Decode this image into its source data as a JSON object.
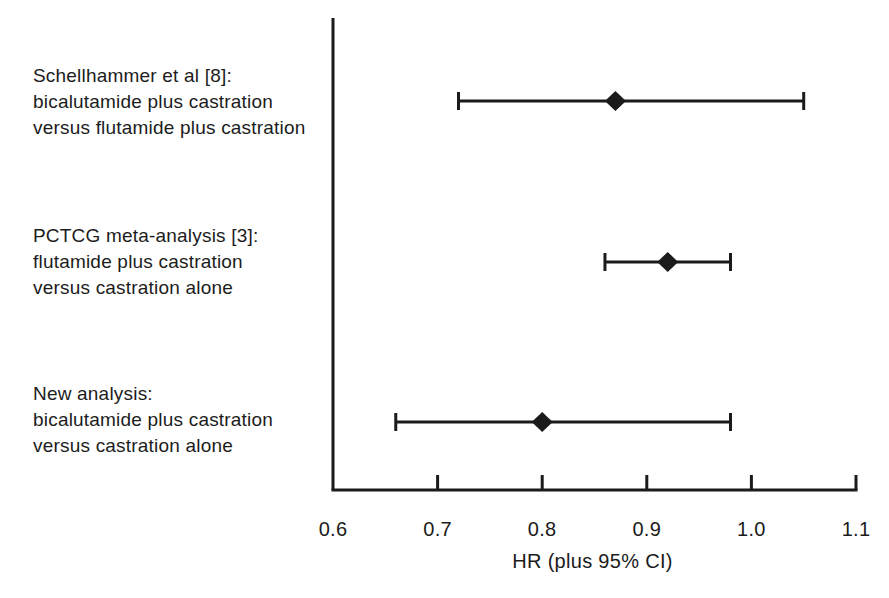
{
  "colors": {
    "foreground": "#1b1b1b",
    "background": "#ffffff"
  },
  "chart_data": {
    "type": "scatter",
    "subtype": "forest-plot",
    "title": "",
    "xlabel": "HR (plus 95% CI)",
    "ylabel": "",
    "xlim": [
      0.6,
      1.1
    ],
    "x_ticks": [
      0.6,
      0.7,
      0.8,
      0.9,
      1.0,
      1.1
    ],
    "x_tick_labels": [
      "0.6",
      "0.7",
      "0.8",
      "0.9",
      "1.0",
      "1.1"
    ],
    "grid": false,
    "legend": false,
    "marker": "diamond",
    "studies": [
      {
        "label_lines": [
          "Schellhammer et al [8]:",
          "bicalutamide plus castration",
          "versus flutamide plus castration"
        ],
        "hr": 0.87,
        "ci_low": 0.72,
        "ci_high": 1.05
      },
      {
        "label_lines": [
          "PCTCG meta-analysis [3]:",
          "flutamide plus castration",
          "versus castration alone"
        ],
        "hr": 0.92,
        "ci_low": 0.86,
        "ci_high": 0.98
      },
      {
        "label_lines": [
          "New analysis:",
          "bicalutamide plus castration",
          "versus castration alone"
        ],
        "hr": 0.8,
        "ci_low": 0.66,
        "ci_high": 0.98
      }
    ]
  }
}
